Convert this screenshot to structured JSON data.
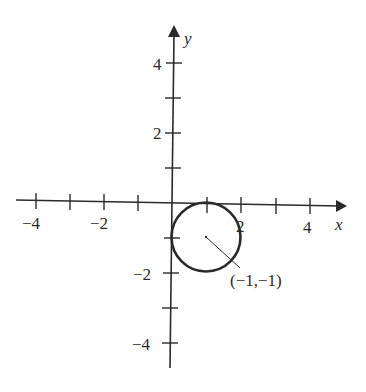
{
  "diagram": {
    "type": "coordinate-plane",
    "axes": {
      "x_label": "x",
      "y_label": "y",
      "x_ticks": [
        -4,
        -3,
        -2,
        -1,
        1,
        2,
        3,
        4
      ],
      "y_ticks": [
        4,
        3,
        2,
        1,
        -1,
        -2,
        -3,
        -4
      ],
      "x_tick_labels": [
        {
          "value": -4,
          "text": "−4"
        },
        {
          "value": -2,
          "text": "−2"
        },
        {
          "value": 2,
          "text": "2"
        },
        {
          "value": 4,
          "text": "4"
        }
      ],
      "y_tick_labels": [
        {
          "value": 4,
          "text": "4"
        },
        {
          "value": 2,
          "text": "2"
        },
        {
          "value": -2,
          "text": "−2"
        },
        {
          "value": -4,
          "text": "−4"
        }
      ]
    },
    "circle": {
      "drawn_center": [
        1,
        -1
      ],
      "radius": 1,
      "annotation": "(−1,−1)"
    },
    "colors": {
      "ink": "#2a2a2a",
      "background": "#ffffff"
    }
  }
}
